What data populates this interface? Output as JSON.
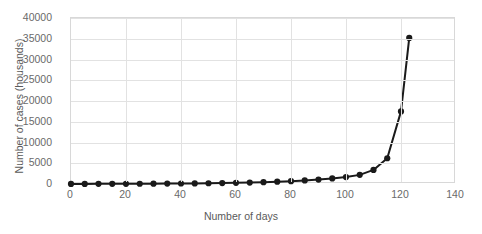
{
  "chart_data": {
    "type": "line",
    "title": "",
    "xlabel": "Number of days",
    "ylabel": "Number of cases (housands)",
    "xlim": [
      0,
      140
    ],
    "ylim": [
      0,
      40000
    ],
    "xticks": [
      0,
      20,
      40,
      60,
      80,
      100,
      120,
      140
    ],
    "yticks": [
      0,
      5000,
      10000,
      15000,
      20000,
      25000,
      30000,
      35000,
      40000
    ],
    "grid": true,
    "legend": false,
    "marker_color": "#1a1a1a",
    "line_color": "#1a1a1a",
    "grid_color": "#e2e2e2",
    "axis_text_color": "#6a6a6a",
    "x": [
      0,
      5,
      10,
      15,
      20,
      25,
      30,
      35,
      40,
      45,
      50,
      55,
      60,
      65,
      70,
      75,
      80,
      85,
      90,
      95,
      100,
      105,
      110,
      115,
      120,
      123
    ],
    "y": [
      20,
      25,
      31,
      39,
      48,
      60,
      75,
      94,
      117,
      146,
      182,
      227,
      283,
      353,
      441,
      550,
      686,
      856,
      1068,
      1332,
      1662,
      2200,
      3400,
      6200,
      17500,
      35200
    ]
  }
}
